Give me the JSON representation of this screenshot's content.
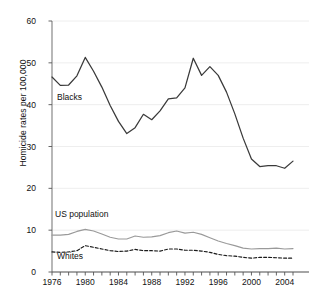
{
  "chart_data": {
    "type": "line",
    "title": "",
    "xlabel": "",
    "ylabel": "Homicide rates per 100,000",
    "xlim": [
      1976,
      2005
    ],
    "ylim": [
      0,
      60
    ],
    "grid": true,
    "grid_axis": "y",
    "legend": "inline annotations",
    "x": [
      1976,
      1977,
      1978,
      1979,
      1980,
      1981,
      1982,
      1983,
      1984,
      1985,
      1986,
      1987,
      1988,
      1989,
      1990,
      1991,
      1992,
      1993,
      1994,
      1995,
      1996,
      1997,
      1998,
      1999,
      2000,
      2001,
      2002,
      2003,
      2004,
      2005
    ],
    "yticks": [
      0,
      10,
      20,
      30,
      40,
      50,
      60
    ],
    "xticklabels": [
      "1976",
      "1980",
      "1984",
      "1988",
      "1992",
      "1996",
      "2000",
      "2004"
    ],
    "xticklabel_years": [
      1976,
      1980,
      1984,
      1988,
      1992,
      1996,
      2000,
      2004
    ],
    "series": [
      {
        "name": "Blacks",
        "style": "solid",
        "color": "#3a3a3a",
        "values": [
          46.6,
          44.6,
          44.7,
          46.9,
          51.3,
          48.0,
          44.2,
          39.8,
          36.0,
          33.1,
          34.5,
          37.7,
          36.4,
          38.5,
          41.4,
          41.6,
          44.0,
          51.1,
          47.0,
          49.1,
          47.0,
          43.0,
          37.8,
          32.0,
          27.0,
          25.2,
          25.4,
          25.4,
          24.8,
          26.5
        ]
      },
      {
        "name": "US population",
        "style": "solid",
        "color": "#9a9a9a",
        "values": [
          8.8,
          8.8,
          9.0,
          9.7,
          10.2,
          9.8,
          9.1,
          8.3,
          7.9,
          7.9,
          8.6,
          8.3,
          8.4,
          8.7,
          9.4,
          9.8,
          9.3,
          9.5,
          9.0,
          8.2,
          7.4,
          6.8,
          6.3,
          5.7,
          5.5,
          5.6,
          5.6,
          5.7,
          5.5,
          5.6
        ]
      },
      {
        "name": "Whites",
        "style": "dashed",
        "color": "#1a1a1a",
        "values": [
          4.8,
          4.7,
          4.8,
          5.1,
          6.3,
          5.9,
          5.5,
          5.1,
          4.9,
          5.0,
          5.4,
          5.1,
          5.1,
          5.0,
          5.5,
          5.5,
          5.2,
          5.2,
          5.0,
          4.7,
          4.2,
          3.9,
          3.8,
          3.5,
          3.3,
          3.5,
          3.5,
          3.4,
          3.3,
          3.3
        ]
      }
    ],
    "annotations": [
      {
        "text": "Blacks",
        "x": 1977,
        "y": 42
      },
      {
        "text": "US population",
        "x": 1977,
        "y": 13.5
      },
      {
        "text": "Whites",
        "x": 1977,
        "y": 2.5
      }
    ]
  }
}
